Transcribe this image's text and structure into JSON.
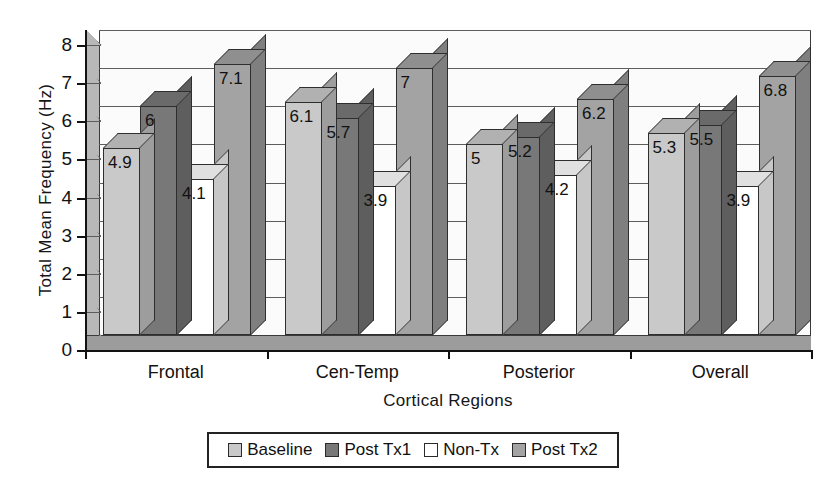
{
  "chart_data": {
    "type": "bar",
    "title": "",
    "xlabel": "Cortical Regions",
    "ylabel": "Total Mean Frequency (Hz)",
    "ylim": [
      0,
      8
    ],
    "y_ticks": [
      0,
      1,
      2,
      3,
      4,
      5,
      6,
      7,
      8
    ],
    "y_tick_labels": [
      "0",
      "1",
      "2",
      "3",
      "4",
      "5",
      "6",
      "7",
      "8"
    ],
    "grid": true,
    "legend_position": "bottom",
    "style": "3d-clustered-column",
    "categories": [
      "Frontal",
      "Cen-Temp",
      "Posterior",
      "Overall"
    ],
    "series": [
      {
        "name": "Baseline",
        "color": "#c9c9c9",
        "values": [
          4.9,
          6.1,
          5,
          5.3
        ],
        "labels": [
          "4.9",
          "6.1",
          "5",
          "5.3"
        ]
      },
      {
        "name": "Post Tx1",
        "color": "#787878",
        "values": [
          6,
          5.7,
          5.2,
          5.5
        ],
        "labels": [
          "6",
          "5.7",
          "5.2",
          "5.5"
        ]
      },
      {
        "name": "Non-Tx",
        "color": "#ffffff",
        "values": [
          4.1,
          3.9,
          4.2,
          3.9
        ],
        "labels": [
          "4.1",
          "3.9",
          "4.2",
          "3.9"
        ]
      },
      {
        "name": "Post Tx2",
        "color": "#a3a3a3",
        "values": [
          7.1,
          7,
          6.2,
          6.8
        ],
        "labels": [
          "7.1",
          "7",
          "6.2",
          "6.8"
        ]
      }
    ]
  },
  "colors": {
    "axis": "#121212",
    "gridline": "#5d5d5d",
    "plot_background": "#fbfbfb",
    "wall": "#b8b8b8",
    "floor": "#9c9c9c",
    "bar_outline": "#2e2e2e",
    "page_background": "#ffffff"
  }
}
